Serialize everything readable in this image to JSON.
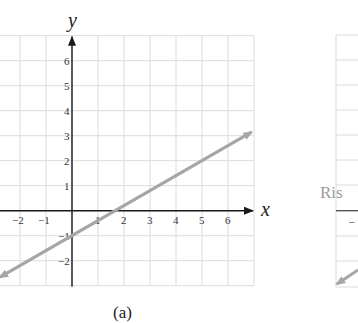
{
  "chart_data": {
    "type": "line",
    "title": "",
    "caption": "(a)",
    "xlabel": "x",
    "ylabel": "y",
    "xlim": [
      -2.77,
      7
    ],
    "ylim": [
      -3,
      7
    ],
    "grid": true,
    "x_ticks": [
      -2,
      -1,
      1,
      2,
      3,
      4,
      5,
      6
    ],
    "y_ticks": [
      6,
      5,
      4,
      3,
      2,
      1,
      -1,
      -2
    ],
    "series": [
      {
        "name": "line",
        "equation": "y = (3/5)x - 1",
        "slope": 0.6,
        "intercept": -1,
        "x": [
          -2.77,
          6.9
        ],
        "y": [
          -2.66,
          3.14
        ],
        "arrows": "both",
        "color": "#a6a6a6"
      }
    ],
    "key_points": [
      {
        "x": 0,
        "y": -1
      },
      {
        "x": 5,
        "y": 2
      }
    ]
  },
  "colors": {
    "grid": "#dcdcdc",
    "axis": "#1a1a1a",
    "line": "#a6a6a6"
  },
  "right_panel": {
    "partial_label": "Ris",
    "partial_tick": "–"
  }
}
